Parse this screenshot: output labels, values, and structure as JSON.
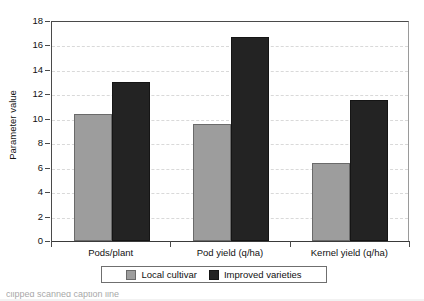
{
  "chart_data": {
    "type": "bar",
    "title": "",
    "xlabel": "",
    "ylabel": "Parameter value",
    "categories": [
      "Pods/plant",
      "Pod yield (q/ha)",
      "Kernel yield (q/ha)"
    ],
    "series": [
      {
        "name": "Local cultivar",
        "color": "#9d9d9d",
        "values": [
          10.4,
          9.6,
          6.4
        ]
      },
      {
        "name": "Improved varieties",
        "color": "#232323",
        "values": [
          13.0,
          16.7,
          11.5
        ]
      }
    ],
    "ylim": [
      0,
      18
    ],
    "ytick_step": 2,
    "yticks": [
      0,
      2,
      4,
      6,
      8,
      10,
      12,
      14,
      16,
      18
    ],
    "ytick_labels": [
      "0",
      "2",
      "4",
      "6",
      "8",
      "10",
      "12",
      "14",
      "16",
      "18"
    ],
    "grid": "horizontal-dashed",
    "legend_position": "bottom-center-boxed"
  },
  "axis": {
    "y_title": "Parameter value"
  },
  "legend": {
    "entries": [
      {
        "label": "Local cultivar",
        "icon": "square-swatch-grey"
      },
      {
        "label": "Improved varieties",
        "icon": "square-swatch-black"
      }
    ]
  },
  "caption": {
    "text": "clipped scanned caption line"
  }
}
